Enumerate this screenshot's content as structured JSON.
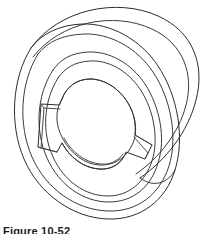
{
  "figure": {
    "title": "Isometric line drawing of a cylindrical pulley hub with keyed bore",
    "caption": "Figure 10-52",
    "caption_visible_fraction": "top edge only (clipped by image bottom)",
    "background_color": "#ffffff",
    "line_color": "#3a3a3a",
    "line_color_dark": "#2b2b2b",
    "line_width_px": 1,
    "canvas": {
      "width": 219,
      "height": 234
    }
  },
  "geometry": {
    "view": "isometric / pictorial",
    "object_type": "pulley-flywheel-with-keyed-bore",
    "description": "Three concentric elliptical faces stepping back to a cylindrical body, with a central oval bore cut by two opposed rectangular keyways",
    "ellipse_center": {
      "x": 104,
      "y": 112
    },
    "ellipse_rotation_deg": -28,
    "rings": [
      {
        "name": "back-body-outline",
        "rx": 86,
        "ry": 70,
        "offset_x": 14,
        "offset_y": -12
      },
      {
        "name": "outer-rim-front-face",
        "rx": 86,
        "ry": 70,
        "offset_x": 0,
        "offset_y": 0
      },
      {
        "name": "outer-rim-inner-edge",
        "rx": 80,
        "ry": 65,
        "offset_x": 0,
        "offset_y": 0
      },
      {
        "name": "recess-step",
        "rx": 62,
        "ry": 50,
        "offset_x": 0,
        "offset_y": 0
      },
      {
        "name": "hub-boss",
        "rx": 57,
        "ry": 45,
        "offset_x": 0,
        "offset_y": 0
      }
    ],
    "bore": {
      "name": "center-bore",
      "rx": 33,
      "ry": 24,
      "depth_offset_x": -2,
      "depth_offset_y": 5,
      "keyway_count": 2,
      "keyway_positions": [
        "left",
        "right"
      ]
    }
  },
  "labels": {
    "figure_number": "Figure 10-52"
  }
}
